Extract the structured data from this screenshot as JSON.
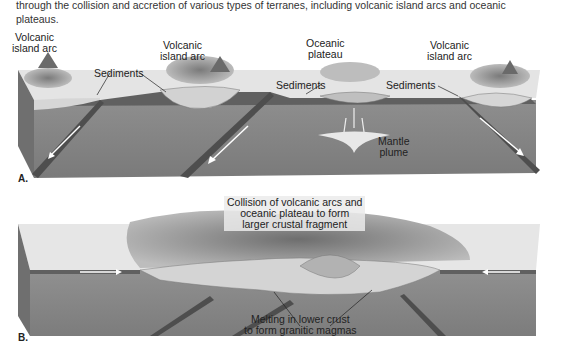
{
  "caption": "through the collision and accretion of various types of terranes, including volcanic island arcs and oceanic plateaus.",
  "panelA": {
    "label": "A.",
    "annotations": {
      "arc1": "Volcanic\nisland arc",
      "arc2": "Volcanic\nisland arc",
      "plateau": "Oceanic\nplateau",
      "arc3": "Volcanic\nisland arc",
      "sed1": "Sediments",
      "sed2": "Sediments",
      "sed3": "Sediments",
      "plume": "Mantle\nplume"
    }
  },
  "panelB": {
    "label": "B.",
    "annotations": {
      "collision": "Collision of volcanic arcs and\noceanic plateau to form\nlarger crustal fragment",
      "melting": "Melting in lower crust\nto form granitic magmas"
    }
  },
  "colors": {
    "mantle": "#8a8a8a",
    "crust_light": "#d8d8d8",
    "ocean_surface": "#e6e6e6",
    "slab": "#555555",
    "terrain": "#9a9a9a"
  }
}
